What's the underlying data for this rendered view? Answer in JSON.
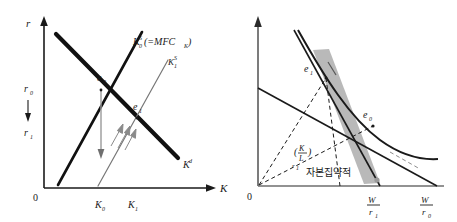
{
  "figure": {
    "title": "",
    "panels": [
      {
        "id": "left",
        "name": "capital-market-equilibrium",
        "axes": {
          "y_label": "r",
          "x_label": "K",
          "origin_label": "0"
        },
        "y_ticks": [
          {
            "label": "r",
            "sub": "0"
          },
          {
            "label": "r",
            "sub": "1"
          }
        ],
        "arrow_between_y_ticks": "↓",
        "x_ticks": [
          {
            "label": "K",
            "sub": "0"
          },
          {
            "label": "K",
            "sub": "1"
          }
        ],
        "curves": [
          {
            "name": "capital-supply-0",
            "label_main": "K",
            "label_sup": "S",
            "label_tail": "(=MFC",
            "label_tail_sub": "K",
            "label_close": ")"
          },
          {
            "name": "capital-supply-1",
            "label_main": "K",
            "label_sup": "S",
            "label_sub": "1"
          },
          {
            "name": "capital-demand",
            "label_main": "K",
            "label_sup": "d"
          }
        ],
        "points": [
          {
            "name": "equilibrium-0",
            "label": "e",
            "sub": "0"
          },
          {
            "name": "equilibrium-1",
            "label": "e",
            "sub": "1"
          }
        ]
      },
      {
        "id": "right",
        "name": "isoquant-isocost-shift",
        "axes": {
          "origin_label": "0"
        },
        "x_ticks": [
          {
            "num": "W",
            "den": "r",
            "den_sub": "1"
          },
          {
            "num": "W",
            "den": "r",
            "den_sub": "0"
          }
        ],
        "points": [
          {
            "name": "tangency-1",
            "label": "e",
            "sub": "1"
          },
          {
            "name": "tangency-0",
            "label": "e",
            "sub": "0"
          }
        ],
        "annotations": [
          {
            "name": "capital-labor-ratio",
            "open": "(",
            "num": "K",
            "den": "L",
            "close": ")",
            "sub_main": "r",
            "sub_sub": "1"
          },
          {
            "name": "capital-intensive-note",
            "text": "자본집약적"
          }
        ]
      }
    ],
    "colors": {
      "ink": "#1a1a1a",
      "thick_line": "#111111",
      "thin_line": "#555555",
      "gray_line": "#808080",
      "shade_fill": "#b3b3b3",
      "background": "#ffffff"
    }
  }
}
